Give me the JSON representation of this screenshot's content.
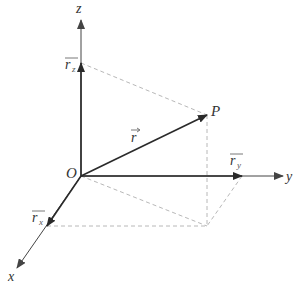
{
  "diagram": {
    "colors": {
      "axis": "#444444",
      "vector": "#2a2a2a",
      "dashed": "#b8b8b8",
      "label": "#333333"
    },
    "axes": {
      "x": {
        "label": "x"
      },
      "y": {
        "label": "y"
      },
      "z": {
        "label": "z"
      }
    },
    "origin": {
      "label": "O"
    },
    "point": {
      "label": "P"
    },
    "vectors": {
      "r": {
        "base": "r",
        "arrow": "→"
      },
      "rx": {
        "base": "r",
        "sub": "x"
      },
      "ry": {
        "base": "r",
        "sub": "y"
      },
      "rz": {
        "base": "r",
        "sub": "z"
      }
    }
  }
}
